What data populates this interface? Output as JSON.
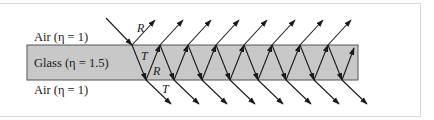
{
  "diagram": {
    "labels": {
      "air_top": "Air (η = 1)",
      "glass": "Glass (η = 1.5)",
      "air_bottom": "Air (η = 1)",
      "reflected": "R",
      "transmitted_in": "T",
      "reflected_in": "R",
      "transmitted_out": "T"
    },
    "colors": {
      "glass_fill": "#c8c8c8",
      "glass_stroke": "#555555",
      "ray": "#1a1a1a",
      "frame": "#d8d8d8"
    },
    "geometry": {
      "glass": {
        "x": 27,
        "y": 45,
        "w": 331,
        "h": 35
      },
      "incident": {
        "x1": 106,
        "y1": 18,
        "x2": 132,
        "y2": 45
      },
      "top_hits": [
        132,
        160,
        188,
        216,
        244,
        272,
        300,
        328
      ],
      "bottom_hits": [
        146,
        174,
        202,
        230,
        258,
        286,
        314,
        342
      ],
      "last_up_end": {
        "x": 354,
        "y": 48
      },
      "reflect_dx": 23,
      "reflect_top_y": 20,
      "transmit_dx": 25,
      "transmit_bottom_y": 104
    }
  }
}
